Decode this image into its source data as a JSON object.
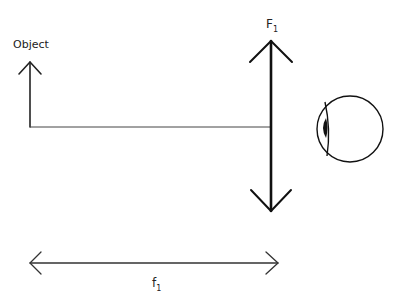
{
  "diagram": {
    "type": "optics-simple-magnifier",
    "colors": {
      "background": "#ffffff",
      "stroke": "#222222",
      "text": "#222222"
    },
    "object": {
      "label": "Object",
      "x": 30,
      "top_y": 62,
      "base_y": 127
    },
    "lens": {
      "label_main": "F",
      "label_sub": "1",
      "x": 271,
      "top_y": 41,
      "bottom_y": 211
    },
    "axis_ray": {
      "from_x": 30,
      "to_x": 270,
      "y": 127
    },
    "eye": {
      "cx": 350,
      "cy": 129,
      "r": 33
    },
    "focal_length": {
      "label_main": "f",
      "label_sub": "1",
      "from_x": 30,
      "to_x": 278,
      "y": 263
    }
  }
}
